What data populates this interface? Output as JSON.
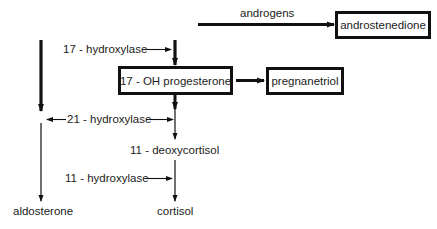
{
  "diagram": {
    "type": "steroid biosynthesis pathway",
    "nodes": {
      "androstenedione": "androstenedione",
      "oh_progesterone": "17 - OH progesterone",
      "pregnanetriol": "pregnanetriol",
      "deoxycortisol": "11 - deoxycortisol",
      "aldosterone": "aldosterone",
      "cortisol": "cortisol"
    },
    "labels": {
      "androgens": "androgens",
      "hydroxylase_17": "17 - hydroxylase",
      "hydroxylase_21": "21 - hydroxylase",
      "hydroxylase_11": "11 - hydroxylase"
    },
    "edges": [
      {
        "from": "(upstream)",
        "to": "androstenedione",
        "label": "androgens"
      },
      {
        "from": "(upstream)",
        "to": "17 - OH progesterone",
        "label": "17 - hydroxylase"
      },
      {
        "from": "17 - OH progesterone",
        "to": "pregnanetriol"
      },
      {
        "from": "17 - OH progesterone",
        "to": "11 - deoxycortisol",
        "label": "21 - hydroxylase"
      },
      {
        "from": "11 - deoxycortisol",
        "to": "cortisol",
        "label": "11 - hydroxylase"
      },
      {
        "from": "(upstream)",
        "to": "aldosterone",
        "label": "21 - hydroxylase"
      }
    ]
  }
}
